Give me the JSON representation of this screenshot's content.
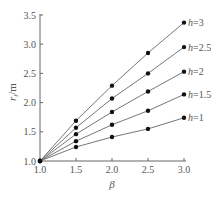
{
  "chart_data": {
    "type": "line",
    "title": "",
    "xlabel": "β",
    "ylabel": "r_l/m",
    "xlim": [
      1.0,
      3.0
    ],
    "ylim": [
      1.0,
      3.5
    ],
    "x_ticks": [
      "1.0",
      "1.5",
      "2.0",
      "2.5",
      "3.0"
    ],
    "y_ticks": [
      "1.0",
      "1.5",
      "2.0",
      "2.5",
      "3.0",
      "3.5"
    ],
    "grid": false,
    "legend_position": "inline-right",
    "x": [
      1.0,
      1.5,
      2.0,
      2.5,
      3.0
    ],
    "series": [
      {
        "name": "h=3",
        "values": [
          1.0,
          1.69,
          2.29,
          2.85,
          3.37
        ]
      },
      {
        "name": "h=2.5",
        "values": [
          1.0,
          1.57,
          2.07,
          2.5,
          2.95
        ]
      },
      {
        "name": "h=2",
        "values": [
          1.0,
          1.46,
          1.84,
          2.19,
          2.53
        ]
      },
      {
        "name": "h=1.5",
        "values": [
          1.0,
          1.34,
          1.62,
          1.86,
          2.14
        ]
      },
      {
        "name": "h=1",
        "values": [
          1.0,
          1.24,
          1.41,
          1.55,
          1.74
        ]
      }
    ]
  }
}
